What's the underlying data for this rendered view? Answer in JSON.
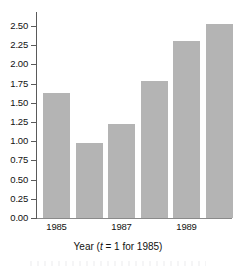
{
  "chart_data": {
    "type": "bar",
    "title": "",
    "subtitle": "",
    "xlabel": "Year (t = 1 for 1985)",
    "xlabel_parts": {
      "lead": "Year (",
      "italic_var": "t",
      "tail": " = 1 for 1985)"
    },
    "ylabel": "",
    "categories": [
      "1985",
      "1986",
      "1987",
      "1988",
      "1989",
      "1990"
    ],
    "x_tick_labels": [
      "1985",
      "1987",
      "1989"
    ],
    "x_tick_categories": [
      0,
      2,
      4
    ],
    "t_values": [
      1,
      2,
      3,
      4,
      5,
      6
    ],
    "values": [
      1.63,
      0.98,
      1.23,
      1.79,
      2.3,
      2.52
    ],
    "ylim": [
      0.0,
      2.5
    ],
    "y_tick_labels": [
      "2.50",
      "2.25",
      "2.00",
      "1.75",
      "1.50",
      "1.25",
      "1.00",
      "0.75",
      "0.50",
      "0.25",
      "0.00"
    ],
    "y_tick_values": [
      2.5,
      2.25,
      2.0,
      1.75,
      1.5,
      1.25,
      1.0,
      0.75,
      0.5,
      0.25,
      0.0
    ],
    "grid": false,
    "legend": false,
    "legend_position": "none",
    "series": [
      {
        "name": "Value",
        "values": [
          1.63,
          0.98,
          1.23,
          1.79,
          2.3,
          2.52
        ]
      }
    ],
    "colors": {
      "bar_fill": "#b4b4b4",
      "axis": "#5a5a5a",
      "baseline": "#8a8a8a",
      "text": "#111111",
      "background": "#ffffff"
    }
  }
}
